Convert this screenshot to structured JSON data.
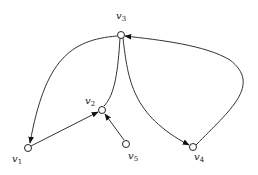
{
  "diagram": {
    "type": "directed-graph",
    "nodes": [
      {
        "id": "v1",
        "label": "v",
        "sub": "1"
      },
      {
        "id": "v2",
        "label": "v",
        "sub": "2"
      },
      {
        "id": "v3",
        "label": "v",
        "sub": "3"
      },
      {
        "id": "v4",
        "label": "v",
        "sub": "4"
      },
      {
        "id": "v5",
        "label": "v",
        "sub": "5"
      }
    ],
    "edges": [
      {
        "from": "v3",
        "to": "v1"
      },
      {
        "from": "v1",
        "to": "v2"
      },
      {
        "from": "v5",
        "to": "v2"
      },
      {
        "from": "v2",
        "to": "v3"
      },
      {
        "from": "v3",
        "to": "v4"
      },
      {
        "from": "v4",
        "to": "v3"
      }
    ]
  }
}
